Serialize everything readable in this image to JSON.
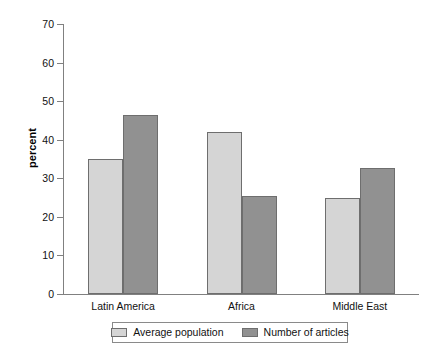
{
  "chart_data": {
    "type": "bar",
    "title": "",
    "xlabel": "",
    "ylabel": "percent",
    "categories": [
      "Latin America",
      "Africa",
      "Middle East"
    ],
    "series": [
      {
        "name": "Average population",
        "color": "#d5d5d5",
        "values": [
          35,
          42,
          25
        ]
      },
      {
        "name": "Number of articles",
        "color": "#919191",
        "values": [
          46.5,
          25.5,
          32.7
        ]
      }
    ],
    "ylim": [
      0,
      70
    ],
    "yticks": [
      0,
      10,
      20,
      30,
      40,
      50,
      60,
      70
    ],
    "ytick_labels": [
      "0",
      "10",
      "20",
      "30",
      "40",
      "50",
      "60",
      "70"
    ],
    "grid": false,
    "legend_position": "bottom"
  },
  "axes": {
    "y_title": "percent"
  },
  "legend": {
    "entries": [
      {
        "label": "Average population"
      },
      {
        "label": "Number of articles"
      }
    ]
  }
}
